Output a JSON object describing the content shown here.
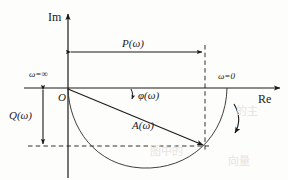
{
  "figure": {
    "type": "diagram",
    "width": 288,
    "height": 180,
    "background_color": "#fdfdfc",
    "line_color": "#1a1a1a"
  },
  "axes": {
    "imaginary_label": "Im",
    "real_label": "Re",
    "origin_label": "O",
    "origin_px": {
      "x": 68,
      "y": 88
    },
    "im_axis_x": 68,
    "re_axis_y": 88,
    "im_arrow_tip_y": 12,
    "re_arrow_tip_x": 282
  },
  "annotations": {
    "omega_infinity": "ω=∞",
    "omega_zero": "ω=0",
    "real_part": "P(ω)",
    "imaginary_part": "Q(ω)",
    "magnitude": "A(ω)",
    "phase": "φ(ω)"
  },
  "measures": {
    "p_omega": {
      "label": "P(ω)",
      "orientation": "horizontal",
      "arrow_y": 52,
      "x_start": 70,
      "x_end": 205
    },
    "q_omega": {
      "label": "Q(ω)",
      "orientation": "vertical",
      "arrow_x": 43,
      "y_start": 88,
      "y_end": 146
    }
  },
  "vector": {
    "label": "A(ω)",
    "from": {
      "x": 68,
      "y": 88
    },
    "to": {
      "x": 205,
      "y": 146
    },
    "description": "phasor from origin to point on Nyquist locus"
  },
  "phase_marker": {
    "label": "φ(ω)",
    "angle_arrow_at": {
      "x": 132,
      "y": 95
    },
    "description": "small curved arrow from real axis down to the A(ω) vector"
  },
  "locus": {
    "description": "Nyquist locus: starts at ω=0 on the positive real axis, sweeps clockwise through the fourth quadrant and returns to the origin as ω→∞",
    "start_point": {
      "x": 227,
      "y": 88,
      "omega": "0"
    },
    "end_point": {
      "x": 68,
      "y": 88,
      "omega": "∞"
    },
    "lowest_y": 168,
    "direction": "clockwise",
    "direction_arrow": {
      "x": 236,
      "y": 128
    }
  },
  "dashed_guides": {
    "vertical": {
      "x": 205,
      "y_start": 45,
      "y_end": 150
    },
    "horizontal": {
      "y": 146,
      "x_start": 28,
      "x_end": 208
    }
  },
  "ghost_text": [
    {
      "text": "的主",
      "x": 236,
      "y": 108
    },
    {
      "text": "图中的",
      "x": 150,
      "y": 148
    },
    {
      "text": "向量",
      "x": 232,
      "y": 158
    }
  ]
}
